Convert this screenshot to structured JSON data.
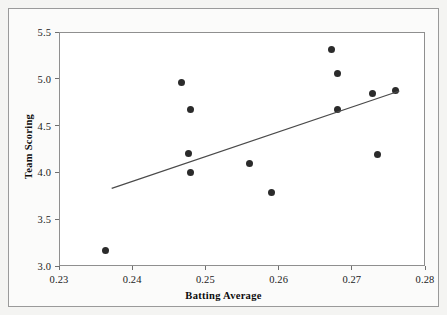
{
  "chart_data": {
    "type": "scatter",
    "title": "",
    "xlabel": "Batting Average",
    "ylabel": "Team Scoring",
    "xlim": [
      0.23,
      0.28
    ],
    "ylim": [
      3.0,
      5.5
    ],
    "xticks": [
      "0.23",
      "0.24",
      "0.25",
      "0.26",
      "0.27",
      "0.28"
    ],
    "xtick_values": [
      0.23,
      0.24,
      0.25,
      0.26,
      0.27,
      0.28
    ],
    "yticks": [
      "3.0",
      "3.5",
      "4.0",
      "4.5",
      "5.0",
      "5.5"
    ],
    "ytick_values": [
      3.0,
      3.5,
      4.0,
      4.5,
      5.0,
      5.5
    ],
    "grid": false,
    "legend": false,
    "marker": "filled-circle",
    "marker_color": "#2b2b2b",
    "points": [
      {
        "x": 0.2363,
        "y": 3.17
      },
      {
        "x": 0.2468,
        "y": 4.96
      },
      {
        "x": 0.248,
        "y": 4.67
      },
      {
        "x": 0.2477,
        "y": 4.2
      },
      {
        "x": 0.248,
        "y": 4.0
      },
      {
        "x": 0.256,
        "y": 4.09
      },
      {
        "x": 0.259,
        "y": 3.79
      },
      {
        "x": 0.2672,
        "y": 5.31
      },
      {
        "x": 0.268,
        "y": 5.06
      },
      {
        "x": 0.268,
        "y": 4.67
      },
      {
        "x": 0.2728,
        "y": 4.84
      },
      {
        "x": 0.2735,
        "y": 4.19
      },
      {
        "x": 0.276,
        "y": 4.88
      }
    ],
    "trend_line": {
      "type": "linear-fit",
      "color": "#4a4a4a",
      "x_start": 0.2372,
      "y_start": 3.83,
      "x_end": 0.2765,
      "y_end": 4.87
    }
  },
  "plot": {
    "background_color": "#ffffff",
    "frame_color": "#8f8f8f",
    "page_background": "#fbfbfa"
  }
}
